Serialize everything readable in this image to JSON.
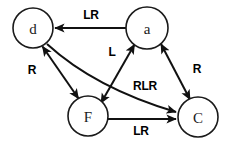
{
  "diagram": {
    "type": "directed-graph",
    "background_color": "#ffffff",
    "stroke_color": "#111111",
    "node_fill": "#ffffff",
    "nodes": [
      {
        "id": "d",
        "label": "d",
        "cx": 33,
        "cy": 28,
        "r": 20
      },
      {
        "id": "a",
        "label": "a",
        "cx": 147,
        "cy": 28,
        "r": 21
      },
      {
        "id": "F",
        "label": "F",
        "cx": 88,
        "cy": 116,
        "r": 20
      },
      {
        "id": "C",
        "label": "C",
        "cx": 198,
        "cy": 117,
        "r": 20
      }
    ],
    "edges": [
      {
        "id": "a-to-d",
        "from": "a",
        "to": "d",
        "label": "LR",
        "direction": "one-way",
        "shape": "straight",
        "label_x": 91,
        "label_y": 15
      },
      {
        "id": "d-F",
        "from": "d",
        "to": "F",
        "label": "R",
        "direction": "bidirectional",
        "shape": "straight",
        "label_x": 32,
        "label_y": 70
      },
      {
        "id": "a-F",
        "from": "a",
        "to": "F",
        "label": "L",
        "direction": "bidirectional",
        "shape": "straight",
        "label_x": 112,
        "label_y": 52
      },
      {
        "id": "a-C",
        "from": "a",
        "to": "C",
        "label": "R",
        "direction": "bidirectional",
        "shape": "straight",
        "label_x": 197,
        "label_y": 69
      },
      {
        "id": "d-to-C",
        "from": "d",
        "to": "C",
        "label": "RLR",
        "direction": "one-way",
        "shape": "curved",
        "label_x": 145,
        "label_y": 86
      },
      {
        "id": "F-to-C",
        "from": "F",
        "to": "C",
        "label": "LR",
        "direction": "one-way",
        "shape": "straight",
        "label_x": 141,
        "label_y": 131
      }
    ]
  }
}
